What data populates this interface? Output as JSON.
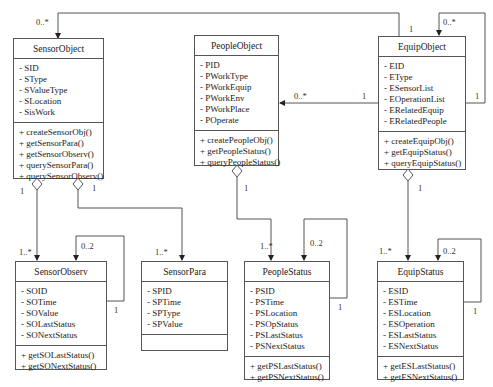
{
  "diagram": {
    "type": "uml-class-diagram",
    "classes": {
      "sensor_object": {
        "name": "SensorObject",
        "attributes": [
          "- SID",
          "- SType",
          "- SValueType",
          "- SLocation",
          "- SisWork"
        ],
        "operations": [
          "+ createSensorObj()",
          "+ getSensorPara()",
          "+ getSensorObserv()",
          "+ querySensorPara()",
          "+ querySensorObserv()"
        ]
      },
      "people_object": {
        "name": "PeopleObject",
        "attributes": [
          "- PID",
          "- PWorkType",
          "- PWorkEquip",
          "- PWorkEnv",
          "- PWorkPlace",
          "- POperate"
        ],
        "operations": [
          "+ createPeopleObj()",
          "+ getPeopleStatus()",
          "+ queryPeopleStatus()"
        ]
      },
      "equip_object": {
        "name": "EquipObject",
        "attributes": [
          "- EID",
          "- EType",
          "- ESensorList",
          "- EOperationList",
          "- ERelatedEquip",
          "- ERelatedPeople"
        ],
        "operations": [
          "+ createEquipObj()",
          "+ getEquipStatus()",
          "+ queryEquipStatus()"
        ]
      },
      "sensor_observ": {
        "name": "SensorObserv",
        "attributes": [
          "- SOID",
          "- SOTime",
          "- SOValue",
          "- SOLastStatus",
          "- SONextStatus"
        ],
        "operations": [
          "+ getSOLastStatus()",
          "+ getSONextStatus()"
        ]
      },
      "sensor_para": {
        "name": "SensorPara",
        "attributes": [
          "- SPID",
          "- SPTime",
          "- SPType",
          "- SPValue"
        ],
        "operations": []
      },
      "people_status": {
        "name": "PeopleStatus",
        "attributes": [
          "- PSID",
          "- PSTime",
          "- PSLocation",
          "- PSOpStatus",
          "- PSLastStatus",
          "- PSNextStatus"
        ],
        "operations": [
          "+ getPSLastStatus()",
          "+ getPSNextStatus()"
        ]
      },
      "equip_status": {
        "name": "EquipStatus",
        "attributes": [
          "- ESID",
          "- ESTime",
          "- ESLocation",
          "- ESOperation",
          "- ESLastStatus",
          "- ESNextStatus"
        ],
        "operations": [
          "+ getESLastStatus()",
          "+ getESNextStatus()"
        ]
      }
    },
    "relationships": [
      {
        "from": "EquipObject",
        "to": "SensorObject",
        "kind": "association",
        "from_mult": "1",
        "to_mult": "0..*"
      },
      {
        "from": "EquipObject",
        "to": "EquipObject",
        "kind": "self-association",
        "from_mult": "1",
        "to_mult": "0..*"
      },
      {
        "from": "EquipObject",
        "to": "PeopleObject",
        "kind": "association",
        "from_mult": "1",
        "to_mult": "0..*"
      },
      {
        "from": "SensorObject",
        "to": "SensorObserv",
        "kind": "aggregation",
        "from_mult": "1",
        "to_mult": "1..*"
      },
      {
        "from": "SensorObject",
        "to": "SensorPara",
        "kind": "aggregation",
        "from_mult": "1",
        "to_mult": "1..*"
      },
      {
        "from": "PeopleObject",
        "to": "PeopleStatus",
        "kind": "aggregation",
        "from_mult": "1",
        "to_mult": "1..*"
      },
      {
        "from": "EquipObject",
        "to": "EquipStatus",
        "kind": "aggregation",
        "from_mult": "1",
        "to_mult": "1..*"
      },
      {
        "from": "SensorObserv",
        "to": "SensorObserv",
        "kind": "self-association",
        "from_mult": "1",
        "to_mult": "0..2"
      },
      {
        "from": "PeopleStatus",
        "to": "PeopleStatus",
        "kind": "self-association",
        "from_mult": "1",
        "to_mult": "0..2"
      },
      {
        "from": "EquipStatus",
        "to": "EquipStatus",
        "kind": "self-association",
        "from_mult": "1",
        "to_mult": "0..2"
      }
    ],
    "labels": {
      "m_sensorobj_top": "0..*",
      "m_equip_top_1": "1",
      "m_equip_self_top": "0..*",
      "m_equip_self_side": "1",
      "m_people_arrow": "0..*",
      "m_equip_people": "1",
      "m_so_left_1": "1",
      "m_so_right_1": "1",
      "m_po_1": "1",
      "m_eo_1": "1",
      "m_sobs_1n": "1..*",
      "m_sobs_02": "0..2",
      "m_sobs_self1": "1",
      "m_spara_1n": "1..*",
      "m_ps_1n": "1..*",
      "m_ps_02": "0..2",
      "m_ps_self1": "1",
      "m_es_1n": "1..*",
      "m_es_02": "0..2",
      "m_es_self1": "1"
    }
  }
}
